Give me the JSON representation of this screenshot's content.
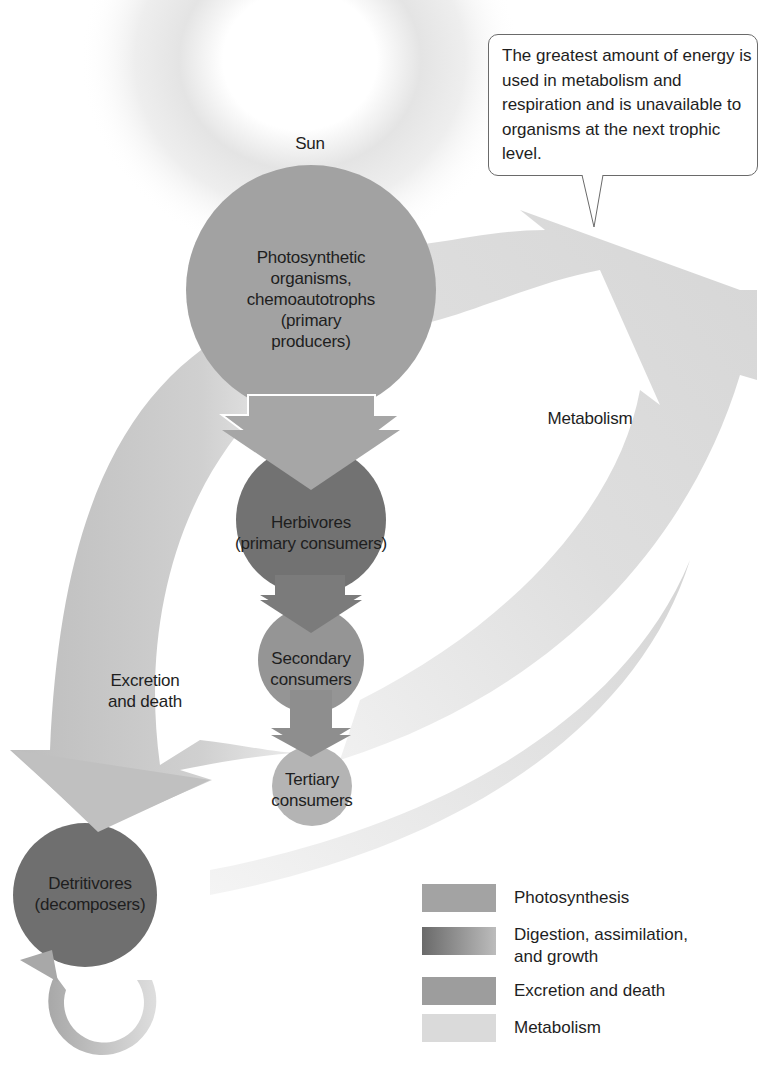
{
  "diagram": {
    "sun_label": "Sun",
    "callout": "The greatest amount of energy is used in metabolism and respiration and is unavailable to organisms at the next trophic level.",
    "nodes": {
      "producers": [
        "Photosynthetic",
        "organisms,",
        "chemoautotrophs",
        "(primary",
        "producers)"
      ],
      "herbivores": [
        "Herbivores",
        "(primary consumers)"
      ],
      "secondary": [
        "Secondary",
        "consumers"
      ],
      "tertiary": [
        "Tertiary",
        "consumers"
      ],
      "detritivores": [
        "Detritivores",
        "(decomposers)"
      ]
    },
    "flow_labels": {
      "metabolism": "Metabolism",
      "excretion": [
        "Excretion",
        "and death"
      ]
    }
  },
  "legend": {
    "items": [
      {
        "label": "Photosynthesis",
        "color": "#a3a3a3"
      },
      {
        "label": "Digestion, assimilation, and growth",
        "color_from": "#6a6a6a",
        "color_to": "#bcbcbc"
      },
      {
        "label": "Excretion and death",
        "color": "#9d9d9d"
      },
      {
        "label": "Metabolism",
        "color": "#dadada"
      }
    ]
  },
  "colors": {
    "producer": "#a2a2a2",
    "herbivore": "#727272",
    "secondary": "#959595",
    "tertiary": "#b4b4b4",
    "detritivore": "#6f6f6f",
    "metabolism_flow": "#dcdcdc",
    "excretion_flow": "#c2c2c2"
  }
}
